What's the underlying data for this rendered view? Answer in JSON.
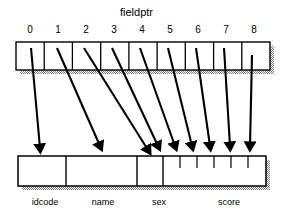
{
  "figure": {
    "title": "fieldptr",
    "colors": {
      "stroke": "#000000",
      "fill": "#ffffff",
      "shadow": "#a0a0a0",
      "background": "#ffffff"
    },
    "pointer_array": {
      "name": "fieldptr",
      "cell_count": 9,
      "indices": [
        "0",
        "1",
        "2",
        "3",
        "4",
        "5",
        "6",
        "7",
        "8"
      ]
    },
    "record_buffer": {
      "fields": [
        {
          "label": "idcode",
          "slots": 1
        },
        {
          "label": "name",
          "slots": 1
        },
        {
          "label": "sex",
          "slots": 1
        },
        {
          "label": "score",
          "slots": 6
        }
      ]
    },
    "arrows": {
      "count": 9,
      "description": "Each pointer cell points into the record buffer"
    }
  }
}
